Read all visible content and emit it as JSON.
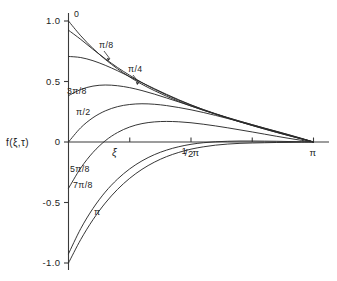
{
  "figure": {
    "background": "#ffffff",
    "ink_color": "#2b2b2b"
  },
  "axes": {
    "y_axis_label": "f(ξ,τ)",
    "x_axis_label": "ξ",
    "y_ticks": [
      {
        "value": 1.0,
        "label": "1.0"
      },
      {
        "value": 0.5,
        "label": "0.5"
      },
      {
        "value": 0.0,
        "label": "0"
      },
      {
        "value": -0.5,
        "label": "-0.5"
      },
      {
        "value": -1.0,
        "label": "-1.0"
      }
    ],
    "x_ticks": [
      {
        "value": 0.7853981634,
        "label": ""
      },
      {
        "value": 1.5707963268,
        "label": "1/2 π"
      },
      {
        "value": 2.3561944902,
        "label": ""
      },
      {
        "value": 3.1415926536,
        "label": "π"
      }
    ],
    "x_tick_half_pi_numerator": "1",
    "x_tick_half_pi_denominator": "2",
    "x_tick_half_pi_symbol": "π",
    "x_tick_pi_symbol": "π"
  },
  "curve_labels": [
    {
      "text": "0",
      "x": 74,
      "y": 17,
      "leader": false
    },
    {
      "text": "π/8",
      "x": 99,
      "y": 48,
      "leader": true,
      "lx1": 104,
      "ly1": 51,
      "lx2": 110,
      "ly2": 59
    },
    {
      "text": "π/4",
      "x": 128,
      "y": 72,
      "leader": true,
      "lx1": 133,
      "ly1": 75,
      "lx2": 139,
      "ly2": 83
    },
    {
      "text": "3π/8",
      "x": 67,
      "y": 94,
      "leader": false
    },
    {
      "text": "π/2",
      "x": 76,
      "y": 115,
      "leader": false
    },
    {
      "text": "5π/8",
      "x": 70,
      "y": 172,
      "leader": false
    },
    {
      "text": "7π/8",
      "x": 73,
      "y": 188,
      "leader": false
    },
    {
      "text": "π",
      "x": 94,
      "y": 215,
      "leader": false
    }
  ],
  "chart_data": {
    "type": "line",
    "title": "",
    "xlabel": "ξ",
    "ylabel": "f(ξ,τ)",
    "xlim": [
      0,
      3.1415926536
    ],
    "ylim": [
      -1.0,
      1.0
    ],
    "grid": false,
    "legend": "inline-curve-labels",
    "x_tick_labels": [
      "1/2 π",
      "π"
    ],
    "y_tick_labels": [
      "1.0",
      "0.5",
      "0",
      "-0.5",
      "-1.0"
    ],
    "series": [
      {
        "name": "0",
        "tau": 0.0,
        "f_at_zero": 1.0,
        "x": [
          0.0,
          0.157,
          0.314,
          0.471,
          0.628,
          0.785,
          0.942,
          1.1,
          1.257,
          1.414,
          1.571,
          1.728,
          1.885,
          2.042,
          2.199,
          2.356,
          2.513,
          2.67,
          2.827,
          2.985,
          3.142
        ],
        "values": [
          1.0,
          0.878,
          0.773,
          0.683,
          0.605,
          0.537,
          0.477,
          0.425,
          0.378,
          0.336,
          0.298,
          0.263,
          0.231,
          0.2,
          0.171,
          0.143,
          0.115,
          0.088,
          0.06,
          0.031,
          0.0
        ]
      },
      {
        "name": "π/8",
        "tau": 0.3927,
        "f_at_zero": 0.924,
        "x": [
          0.0,
          0.157,
          0.314,
          0.471,
          0.628,
          0.785,
          0.942,
          1.1,
          1.257,
          1.414,
          1.571,
          1.728,
          1.885,
          2.042,
          2.199,
          2.356,
          2.513,
          2.67,
          2.827,
          2.985,
          3.142
        ],
        "values": [
          0.924,
          0.848,
          0.766,
          0.688,
          0.616,
          0.551,
          0.491,
          0.437,
          0.389,
          0.345,
          0.305,
          0.268,
          0.234,
          0.202,
          0.172,
          0.143,
          0.114,
          0.086,
          0.058,
          0.029,
          0.0
        ]
      },
      {
        "name": "π/4",
        "tau": 0.7854,
        "f_at_zero": 0.707,
        "x": [
          0.0,
          0.157,
          0.314,
          0.471,
          0.628,
          0.785,
          0.942,
          1.1,
          1.257,
          1.414,
          1.571,
          1.728,
          1.885,
          2.042,
          2.199,
          2.356,
          2.513,
          2.67,
          2.827,
          2.985,
          3.142
        ],
        "values": [
          0.707,
          0.698,
          0.672,
          0.634,
          0.589,
          0.54,
          0.49,
          0.441,
          0.394,
          0.349,
          0.307,
          0.268,
          0.232,
          0.198,
          0.166,
          0.136,
          0.107,
          0.079,
          0.052,
          0.026,
          0.0
        ]
      },
      {
        "name": "3π/8",
        "tau": 1.1781,
        "f_at_zero": 0.383,
        "x": [
          0.0,
          0.157,
          0.314,
          0.471,
          0.628,
          0.785,
          0.942,
          1.1,
          1.257,
          1.414,
          1.571,
          1.728,
          1.885,
          2.042,
          2.199,
          2.356,
          2.513,
          2.67,
          2.827,
          2.985,
          3.142
        ],
        "values": [
          0.383,
          0.434,
          0.462,
          0.471,
          0.465,
          0.449,
          0.425,
          0.396,
          0.364,
          0.331,
          0.297,
          0.263,
          0.23,
          0.198,
          0.167,
          0.137,
          0.108,
          0.08,
          0.053,
          0.026,
          0.0
        ]
      },
      {
        "name": "π/2",
        "tau": 1.5708,
        "f_at_zero": 0.0,
        "x": [
          0.0,
          0.157,
          0.314,
          0.471,
          0.628,
          0.785,
          0.942,
          1.1,
          1.257,
          1.414,
          1.571,
          1.728,
          1.885,
          2.042,
          2.199,
          2.356,
          2.513,
          2.67,
          2.827,
          2.985,
          3.142
        ],
        "values": [
          0.0,
          0.118,
          0.201,
          0.257,
          0.292,
          0.31,
          0.316,
          0.312,
          0.301,
          0.285,
          0.266,
          0.244,
          0.22,
          0.194,
          0.167,
          0.139,
          0.111,
          0.083,
          0.055,
          0.027,
          0.0
        ]
      },
      {
        "name": "5π/8",
        "tau": 1.9635,
        "f_at_zero": -0.383,
        "x": [
          0.0,
          0.157,
          0.314,
          0.471,
          0.628,
          0.785,
          0.942,
          1.1,
          1.257,
          1.414,
          1.571,
          1.728,
          1.885,
          2.042,
          2.199,
          2.356,
          2.513,
          2.67,
          2.827,
          2.985,
          3.142
        ],
        "values": [
          -0.383,
          -0.215,
          -0.086,
          0.01,
          0.078,
          0.124,
          0.152,
          0.166,
          0.17,
          0.167,
          0.159,
          0.147,
          0.133,
          0.117,
          0.1,
          0.083,
          0.065,
          0.047,
          0.03,
          0.014,
          0.0
        ]
      },
      {
        "name": "7π/8",
        "tau": 2.7489,
        "f_at_zero": -0.924,
        "x": [
          0.0,
          0.157,
          0.314,
          0.471,
          0.628,
          0.785,
          0.942,
          1.1,
          1.257,
          1.414,
          1.571,
          1.728,
          1.885,
          2.042,
          2.199,
          2.356,
          2.513,
          2.67,
          2.827,
          2.985,
          3.142
        ],
        "values": [
          -0.924,
          -0.716,
          -0.549,
          -0.414,
          -0.307,
          -0.222,
          -0.156,
          -0.105,
          -0.067,
          -0.039,
          -0.019,
          -0.006,
          0.002,
          0.006,
          0.008,
          0.008,
          0.007,
          0.006,
          0.004,
          0.002,
          0.0
        ]
      },
      {
        "name": "π",
        "tau": 3.1416,
        "f_at_zero": -1.0,
        "x": [
          0.0,
          0.157,
          0.314,
          0.471,
          0.628,
          0.785,
          0.942,
          1.1,
          1.257,
          1.414,
          1.571,
          1.728,
          1.885,
          2.042,
          2.199,
          2.356,
          2.513,
          2.67,
          2.827,
          2.985,
          3.142
        ],
        "values": [
          -1.0,
          -0.806,
          -0.642,
          -0.505,
          -0.392,
          -0.3,
          -0.226,
          -0.167,
          -0.121,
          -0.086,
          -0.059,
          -0.04,
          -0.026,
          -0.017,
          -0.011,
          -0.008,
          -0.006,
          -0.004,
          -0.003,
          -0.001,
          0.0
        ]
      }
    ]
  }
}
